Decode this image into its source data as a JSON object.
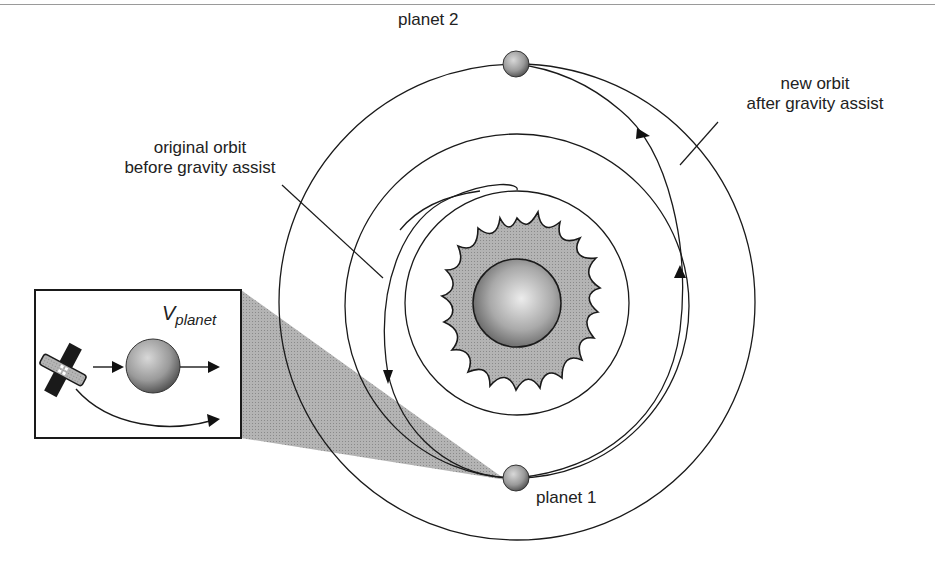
{
  "diagram": {
    "labels": {
      "planet_1": "planet 1",
      "planet_2": "planet 2",
      "original_orbit_line1": "original orbit",
      "original_orbit_line2": "before gravity assist",
      "new_orbit_line1": "new orbit",
      "new_orbit_line2": "after gravity assist",
      "velocity_symbol": "V",
      "velocity_subscript": "planet"
    },
    "objects": {
      "sun": {
        "cx": 517,
        "cy": 303,
        "body_radius": 44,
        "flare_radius": 80
      },
      "inner_orbit": {
        "cx": 517,
        "cy": 303,
        "r": 112
      },
      "planet1_orbit": {
        "cx": 517,
        "cy": 303,
        "r": 172
      },
      "planet2_orbit": {
        "cx": 517,
        "cy": 302,
        "r": 238
      },
      "planet_1": {
        "cx": 516,
        "cy": 478,
        "r": 13
      },
      "planet_2": {
        "cx": 516,
        "cy": 64,
        "r": 13
      },
      "inset_box": {
        "x": 35,
        "y": 290,
        "w": 206,
        "h": 148
      }
    },
    "colors": {
      "line": "#1a1a1a",
      "cone": "#a8a8a8",
      "sun_flare": "#b5b5b5",
      "sun_body_light": "#e8e8e8",
      "sun_body_dark": "#6a6a6a"
    }
  }
}
